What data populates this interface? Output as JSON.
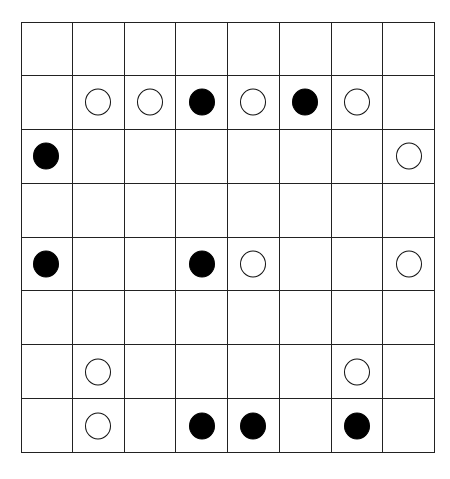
{
  "board": {
    "rows": 8,
    "cols": 8,
    "colors": {
      "black": "#000000",
      "white": "#ffffff",
      "grid": "#222222"
    },
    "pieces": [
      {
        "row": 1,
        "col": 1,
        "color": "white"
      },
      {
        "row": 1,
        "col": 2,
        "color": "white"
      },
      {
        "row": 1,
        "col": 3,
        "color": "black"
      },
      {
        "row": 1,
        "col": 4,
        "color": "white"
      },
      {
        "row": 1,
        "col": 5,
        "color": "black"
      },
      {
        "row": 1,
        "col": 6,
        "color": "white"
      },
      {
        "row": 2,
        "col": 0,
        "color": "black"
      },
      {
        "row": 2,
        "col": 7,
        "color": "white"
      },
      {
        "row": 4,
        "col": 0,
        "color": "black"
      },
      {
        "row": 4,
        "col": 3,
        "color": "black"
      },
      {
        "row": 4,
        "col": 4,
        "color": "white"
      },
      {
        "row": 4,
        "col": 7,
        "color": "white"
      },
      {
        "row": 6,
        "col": 1,
        "color": "white"
      },
      {
        "row": 6,
        "col": 6,
        "color": "white"
      },
      {
        "row": 7,
        "col": 1,
        "color": "white"
      },
      {
        "row": 7,
        "col": 3,
        "color": "black"
      },
      {
        "row": 7,
        "col": 4,
        "color": "black"
      },
      {
        "row": 7,
        "col": 6,
        "color": "black"
      }
    ]
  }
}
